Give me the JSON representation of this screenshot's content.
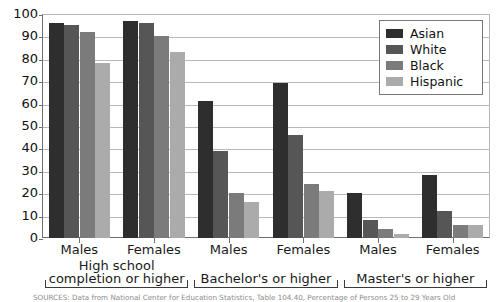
{
  "chart_data": {
    "type": "bar",
    "title": "",
    "xlabel": "",
    "ylabel": "",
    "ylim": [
      0,
      100
    ],
    "ytick_step": 10,
    "grid": true,
    "legend_position": "top-right",
    "categories": [
      "Males",
      "Females",
      "Males",
      "Females",
      "Males",
      "Females"
    ],
    "groups": [
      {
        "label": "High school\ncompletion or higher",
        "categories": [
          "Males",
          "Females"
        ]
      },
      {
        "label": "Bachelor's or higher",
        "categories": [
          "Males",
          "Females"
        ]
      },
      {
        "label": "Master's or higher",
        "categories": [
          "Males",
          "Females"
        ]
      }
    ],
    "yticks": [
      "0",
      "10",
      "20",
      "30",
      "40",
      "50",
      "60",
      "70",
      "80",
      "90",
      "100"
    ],
    "series": [
      {
        "name": "Asian",
        "color": "#2e2e2e",
        "values": [
          96,
          97,
          61,
          69,
          20,
          28
        ]
      },
      {
        "name": "White",
        "color": "#565656",
        "values": [
          95,
          96,
          39,
          46,
          8,
          12
        ]
      },
      {
        "name": "Black",
        "color": "#7b7b7b",
        "values": [
          92,
          90,
          20,
          24,
          4,
          6
        ]
      },
      {
        "name": "Hispanic",
        "color": "#ababab",
        "values": [
          78,
          83,
          16,
          21,
          2,
          6
        ]
      }
    ]
  },
  "legend": {
    "items": [
      {
        "label": "Asian"
      },
      {
        "label": "White"
      },
      {
        "label": "Black"
      },
      {
        "label": "Hispanic"
      }
    ]
  },
  "source": {
    "text": "SOURCES: Data from National Center for Education Statistics, Table 104.40, Percentage of Persons 25 to 29 Years Old"
  }
}
